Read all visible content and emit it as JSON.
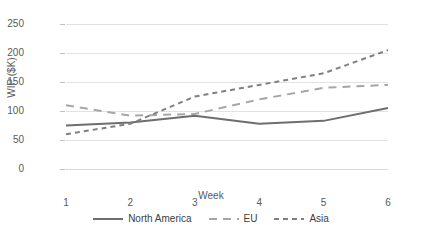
{
  "chart_data": {
    "type": "line",
    "title": "",
    "xlabel": "Week",
    "ylabel": "WIP ($K)",
    "x": [
      1,
      2,
      3,
      4,
      5,
      6
    ],
    "xtick_labels": [
      "1",
      "2",
      "3",
      "4",
      "5",
      "6"
    ],
    "ytick_labels": [
      "0",
      "50",
      "100",
      "150",
      "200",
      "250"
    ],
    "yticks": [
      0,
      50,
      100,
      150,
      200,
      250
    ],
    "ylim": [
      0,
      250
    ],
    "grid": "horizontal",
    "legend_position": "bottom",
    "series": [
      {
        "name": "North America",
        "values": [
          75,
          80,
          92,
          78,
          83,
          105
        ],
        "style": "solid",
        "color": "#6e6e6e"
      },
      {
        "name": "EU",
        "values": [
          110,
          92,
          95,
          120,
          140,
          145
        ],
        "style": "long-dash",
        "color": "#a6a6a6"
      },
      {
        "name": "Asia",
        "values": [
          60,
          78,
          125,
          145,
          165,
          205
        ],
        "style": "short-dash",
        "color": "#808080"
      }
    ]
  },
  "legend": {
    "items": [
      {
        "label": "North America"
      },
      {
        "label": "EU"
      },
      {
        "label": "Asia"
      }
    ]
  }
}
